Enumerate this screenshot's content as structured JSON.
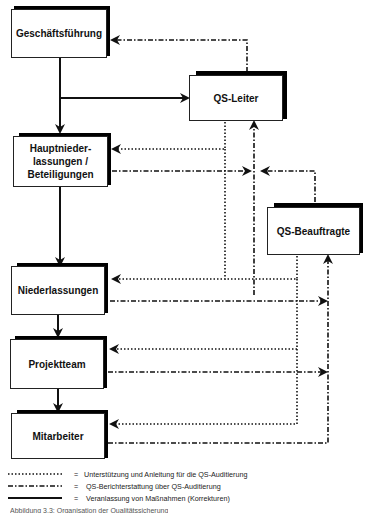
{
  "diagram": {
    "nodes": [
      {
        "id": "geschaeftsfuehrung",
        "label": "Geschäftsführung"
      },
      {
        "id": "qs_leiter",
        "label": "QS-Leiter"
      },
      {
        "id": "hauptniederlassungen",
        "label": "Hauptnieder-\nlassungen /\nBeteiligungen",
        "lines": [
          "Hauptnieder-",
          "lassungen /",
          "Beteiligungen"
        ]
      },
      {
        "id": "qs_beauftragte",
        "label": "QS-Beauftragte"
      },
      {
        "id": "niederlassungen",
        "label": "Niederlassungen"
      },
      {
        "id": "projektteam",
        "label": "Projektteam"
      },
      {
        "id": "mitarbeiter",
        "label": "Mitarbeiter"
      }
    ],
    "edges": [
      {
        "from": "geschaeftsfuehrung",
        "to": "hauptniederlassungen",
        "style": "solid"
      },
      {
        "from": "geschaeftsfuehrung",
        "to": "qs_leiter",
        "style": "solid"
      },
      {
        "from": "hauptniederlassungen",
        "to": "niederlassungen",
        "style": "solid"
      },
      {
        "from": "niederlassungen",
        "to": "projektteam",
        "style": "solid"
      },
      {
        "from": "projektteam",
        "to": "mitarbeiter",
        "style": "solid"
      },
      {
        "from": "qs_leiter",
        "to": "geschaeftsfuehrung",
        "style": "dash-dot"
      },
      {
        "from": "qs_leiter",
        "to": "hauptniederlassungen",
        "style": "dotted"
      },
      {
        "from": "qs_leiter",
        "to": "niederlassungen",
        "style": "dotted"
      },
      {
        "from": "hauptniederlassungen",
        "to": "qs_leiter",
        "style": "dash-dot"
      },
      {
        "from": "qs_beauftragte",
        "to": "qs_leiter",
        "style": "dash-dot"
      },
      {
        "from": "niederlassungen",
        "to": "qs_leiter",
        "style": "dash-dot"
      },
      {
        "from": "qs_beauftragte",
        "to": "niederlassungen",
        "style": "dotted"
      },
      {
        "from": "qs_beauftragte",
        "to": "projektteam",
        "style": "dotted"
      },
      {
        "from": "qs_beauftragte",
        "to": "mitarbeiter",
        "style": "dotted"
      },
      {
        "from": "niederlassungen",
        "to": "qs_beauftragte",
        "style": "dash-dot"
      },
      {
        "from": "projektteam",
        "to": "qs_beauftragte",
        "style": "dash-dot"
      },
      {
        "from": "mitarbeiter",
        "to": "qs_beauftragte",
        "style": "dash-dot"
      }
    ]
  },
  "legend": {
    "items": [
      {
        "style": "dotted",
        "equals": "=",
        "text": "Unterstützung und Anleitung für die QS-Auditierung"
      },
      {
        "style": "dash-dot",
        "equals": "=",
        "text": "QS-Berichterstattung über QS-Auditierung"
      },
      {
        "style": "solid",
        "equals": "=",
        "text": "Veranlassung von Maßnahmen (Korrekturen)"
      }
    ]
  },
  "caption": {
    "text": "Abbildung 3.3: Organisation der Qualitätssicherung"
  },
  "colors": {
    "line": "#111111",
    "background": "#ffffff"
  }
}
